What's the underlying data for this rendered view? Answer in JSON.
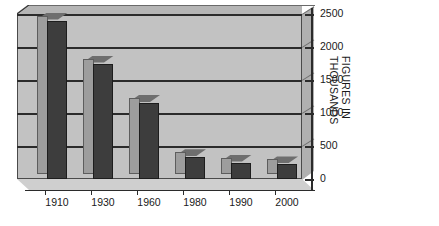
{
  "chart_data": {
    "type": "bar",
    "title": "",
    "subtitle": "",
    "xlabel": "",
    "ylabel": "FIGURES IN THOUSANDS",
    "ylabel_lines": [
      "FIGURES IN",
      "THOUSANDS"
    ],
    "categories": [
      "1910",
      "1930",
      "1960",
      "1980",
      "1990",
      "2000"
    ],
    "values": [
      2400,
      1750,
      1150,
      330,
      250,
      220
    ],
    "yticks": [
      0,
      500,
      1000,
      1500,
      2000,
      2500
    ],
    "ytick_labels": [
      "0",
      "500",
      "1000",
      "1500",
      "2000",
      "2500"
    ],
    "ylim": [
      0,
      2500
    ],
    "grid": true,
    "legend": false,
    "style": "3d-column",
    "colors": {
      "bar_front": "#3d3d3d",
      "bar_left": "#9d9d9d",
      "bar_top": "#6e6e6e",
      "plot_background": "#c2c2c2",
      "floor": "#cfcfcf",
      "gridline": "#2b2b2b",
      "axis": "#2b2b2b",
      "text": "#1a1a1a",
      "page_background": "#ffffff"
    }
  }
}
